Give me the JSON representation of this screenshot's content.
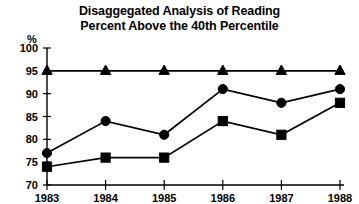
{
  "figure": {
    "title_line1": "Disaggegated Analysis of Reading",
    "title_line2": "Percent Above the 40th Percentile",
    "y_axis_unit_label": "%",
    "ink_color": "#000000",
    "background_color": "#ffffff"
  },
  "chart_data": {
    "type": "line",
    "title": "Disaggegated Analysis of Reading Percent Above the 40th Percentile",
    "xlabel": "",
    "ylabel": "%",
    "categories": [
      "1983",
      "1984",
      "1985",
      "1986",
      "1987",
      "1988"
    ],
    "x": [
      1983,
      1984,
      1985,
      1986,
      1987,
      1988
    ],
    "ylim": [
      70,
      100
    ],
    "yticks": [
      70,
      75,
      80,
      85,
      90,
      95,
      100
    ],
    "ytick_labels": [
      "70",
      "75",
      "80",
      "85",
      "90",
      "95",
      "100"
    ],
    "xtick_labels": [
      "1983",
      "1984",
      "1985",
      "1986",
      "1987",
      "1988"
    ],
    "grid": false,
    "legend": "none",
    "series": [
      {
        "name": "Triangle series",
        "marker": "triangle",
        "color": "#000000",
        "values": [
          95,
          95,
          95,
          95,
          95,
          95
        ]
      },
      {
        "name": "Circle series",
        "marker": "circle",
        "color": "#000000",
        "values": [
          77,
          84,
          81,
          91,
          88,
          91
        ]
      },
      {
        "name": "Square series",
        "marker": "square",
        "color": "#000000",
        "values": [
          74,
          76,
          76,
          84,
          81,
          88
        ]
      }
    ]
  }
}
